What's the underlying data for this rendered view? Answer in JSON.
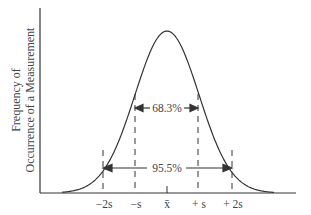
{
  "chart_data": {
    "type": "line",
    "title": "",
    "xlabel": "",
    "ylabel": "Frequency of Occurrence of a Measurement",
    "ylabel_lines": [
      "Frequency of",
      "Occurrence of a Measurement"
    ],
    "tick_labels": [
      "−2s",
      "−s",
      "x̄",
      "+s",
      "+2s"
    ],
    "tick_positions_sd": [
      -2,
      -1,
      0,
      1,
      2
    ],
    "curve": "normal distribution (Gaussian bell curve)",
    "annotations": [
      {
        "label": "68.3%",
        "from": -1,
        "to": 1
      },
      {
        "label": "95.5%",
        "from": -2,
        "to": 2
      }
    ],
    "grid": false,
    "legend": null
  },
  "labels": {
    "ylabel_line1": "Frequency of",
    "ylabel_line2": "Occurrence of a Measurement",
    "ticks": [
      "−2s",
      "−s",
      "x̄",
      "+ s",
      "+ 2s"
    ],
    "pct1": "68.3%",
    "pct2": "95.5%"
  },
  "colors": {
    "line": "#333333",
    "background": "#ffffff"
  }
}
